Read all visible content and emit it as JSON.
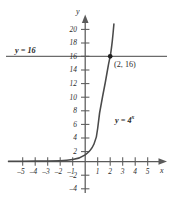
{
  "chart_data": {
    "type": "line",
    "title": "",
    "xlabel": "x",
    "ylabel": "y",
    "xlim": [
      -6.2,
      6.2
    ],
    "ylim": [
      -5.5,
      23.5
    ],
    "grid": false,
    "legend": "none",
    "x_ticks": [
      {
        "value": -5,
        "label": "–5"
      },
      {
        "value": -4,
        "label": "–4"
      },
      {
        "value": -3,
        "label": "–3"
      },
      {
        "value": -2,
        "label": "–2"
      },
      {
        "value": -1,
        "label": "–1"
      },
      {
        "value": 1,
        "label": "1"
      },
      {
        "value": 2,
        "label": "2"
      },
      {
        "value": 3,
        "label": "3"
      },
      {
        "value": 4,
        "label": "4"
      },
      {
        "value": 5,
        "label": "5"
      }
    ],
    "y_ticks": [
      {
        "value": 20,
        "label": "20"
      },
      {
        "value": 18,
        "label": "18"
      },
      {
        "value": 16,
        "label": "16"
      },
      {
        "value": 14,
        "label": "14"
      },
      {
        "value": 12,
        "label": "12"
      },
      {
        "value": 10,
        "label": "10"
      },
      {
        "value": 8,
        "label": "8"
      },
      {
        "value": 6,
        "label": "6"
      },
      {
        "value": 4,
        "label": "4"
      },
      {
        "value": 2,
        "label": "2"
      },
      {
        "value": -2,
        "label": "–2"
      },
      {
        "value": -4,
        "label": "–4"
      }
    ],
    "series": [
      {
        "name": "y = 4^x",
        "kind": "exponential",
        "base": 4,
        "label_html": "y = 4<sup>x</sup>",
        "label_text": "y = 4x",
        "color": "#4a4a4a",
        "points": [
          {
            "x": -6,
            "y": 0.000244
          },
          {
            "x": -5,
            "y": 0.000977
          },
          {
            "x": -4,
            "y": 0.003906
          },
          {
            "x": -3,
            "y": 0.015625
          },
          {
            "x": -2,
            "y": 0.0625
          },
          {
            "x": -1,
            "y": 0.25
          },
          {
            "x": 0,
            "y": 1
          },
          {
            "x": 0.5,
            "y": 2
          },
          {
            "x": 1,
            "y": 4
          },
          {
            "x": 1.5,
            "y": 8
          },
          {
            "x": 2,
            "y": 16
          },
          {
            "x": 2.25,
            "y": 22.6
          }
        ]
      },
      {
        "name": "y = 16",
        "kind": "horizontal",
        "y": 16,
        "label_text": "y = 16",
        "color": "#6b6b6b"
      }
    ],
    "annotations": [
      {
        "name": "intersection-point",
        "x": 2,
        "y": 16,
        "label": "(2, 16)"
      }
    ]
  },
  "labels": {
    "y_axis_name": "y",
    "x_axis_name": "x",
    "line_label": "y = 16",
    "point_label": "(2, 16)"
  },
  "colors": {
    "axis": "#5a5a5a",
    "curve": "#4a4a4a",
    "line": "#6b6b6b",
    "text": "#2b2b2b",
    "background": "#ffffff"
  }
}
